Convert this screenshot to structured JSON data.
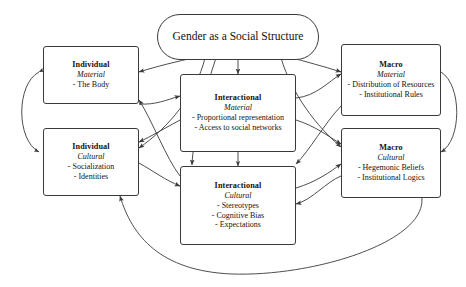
{
  "diagram": {
    "title": "Gender as a Social Structure",
    "center": {
      "label": "Gender as a Social Structure",
      "shape": "oval"
    },
    "nodes": [
      {
        "id": "individual-material",
        "level": "Individual",
        "domain": "Material",
        "items": [
          "- The Body"
        ]
      },
      {
        "id": "individual-cultural",
        "level": "Individual",
        "domain": "Cultural",
        "items": [
          "- Socialization",
          "- Identities"
        ]
      },
      {
        "id": "interactional-material",
        "level": "Interactional",
        "domain": "Material",
        "items": [
          "- Proportional representation",
          "- Access to social networks"
        ]
      },
      {
        "id": "interactional-cultural",
        "level": "Interactional",
        "domain": "Cultural",
        "items": [
          "- Stereotypes",
          "- Cognitive Bias",
          "- Expectations"
        ]
      },
      {
        "id": "macro-material",
        "level": "Macro",
        "domain": "Material",
        "items": [
          "- Distribution of Resources",
          "- Institutional Rules"
        ]
      },
      {
        "id": "macro-cultural",
        "level": "Macro",
        "domain": "Cultural",
        "items": [
          "- Hegemonic Beliefs",
          "- Institutional Logics"
        ]
      }
    ],
    "colors": {
      "stroke": "#3a3a3a",
      "text": "#15120f",
      "background": "#ffffff"
    }
  }
}
